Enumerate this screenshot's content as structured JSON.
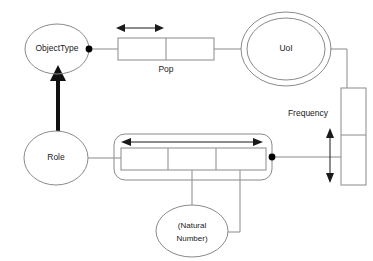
{
  "diagram": {
    "type": "object-role-modeling-diagram",
    "colors": {
      "shape_stroke": "#8a8a8a",
      "text": "#1a1a1a",
      "constraint": "#1a1a1a",
      "subtype_arrow": "#111111",
      "background": "#ffffff"
    },
    "entities": [
      {
        "id": "object-type",
        "label": "ObjectType",
        "shape": "ellipse"
      },
      {
        "id": "uoi",
        "label": "UoI",
        "shape": "double-ellipse"
      },
      {
        "id": "role",
        "label": "Role",
        "shape": "ellipse"
      },
      {
        "id": "natural-number",
        "label": "(Natural\nNumber)",
        "label_line1": "(Natural",
        "label_line2": "Number)",
        "shape": "ellipse"
      }
    ],
    "fact_types": [
      {
        "id": "pop",
        "label": "Pop",
        "roles": 2
      },
      {
        "id": "unlabeled-ternary",
        "label": "",
        "roles": 3
      },
      {
        "id": "frequency",
        "label": "Frequency",
        "roles": 2,
        "orientation": "vertical"
      }
    ],
    "labels": {
      "object_type": "ObjectType",
      "uoi": "UoI",
      "role": "Role",
      "natural_number_line1": "(Natural",
      "natural_number_line2": "Number)",
      "pop": "Pop",
      "frequency": "Frequency"
    }
  }
}
